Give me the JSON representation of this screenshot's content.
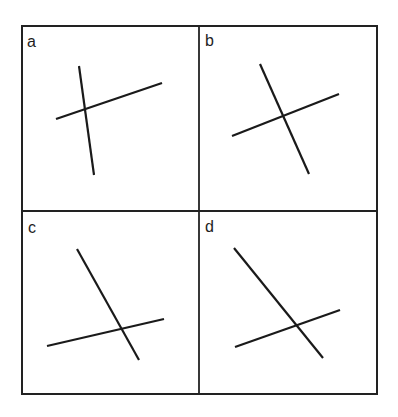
{
  "figure": {
    "background": "#ffffff",
    "line_color": "#1a1a1a",
    "frame": {
      "x1": 22,
      "y1": 26,
      "x2": 377,
      "y2": 394
    },
    "dividers": {
      "vertical_x": 199,
      "horizontal_y": 211
    },
    "panels": [
      {
        "id": "a",
        "label": "a",
        "label_pos": {
          "x": 27,
          "y": 47
        },
        "lines": [
          {
            "x1": 79,
            "y1": 66,
            "x2": 94,
            "y2": 175
          },
          {
            "x1": 56,
            "y1": 119,
            "x2": 162,
            "y2": 83
          }
        ]
      },
      {
        "id": "b",
        "label": "b",
        "label_pos": {
          "x": 205,
          "y": 46
        },
        "lines": [
          {
            "x1": 260,
            "y1": 64,
            "x2": 309,
            "y2": 174
          },
          {
            "x1": 232,
            "y1": 136,
            "x2": 339,
            "y2": 94
          }
        ]
      },
      {
        "id": "c",
        "label": "c",
        "label_pos": {
          "x": 28,
          "y": 233
        },
        "lines": [
          {
            "x1": 77,
            "y1": 249,
            "x2": 139,
            "y2": 360
          },
          {
            "x1": 47,
            "y1": 346,
            "x2": 164,
            "y2": 319
          }
        ]
      },
      {
        "id": "d",
        "label": "d",
        "label_pos": {
          "x": 205,
          "y": 232
        },
        "lines": [
          {
            "x1": 234,
            "y1": 248,
            "x2": 323,
            "y2": 358
          },
          {
            "x1": 235,
            "y1": 347,
            "x2": 340,
            "y2": 310
          }
        ]
      }
    ]
  }
}
